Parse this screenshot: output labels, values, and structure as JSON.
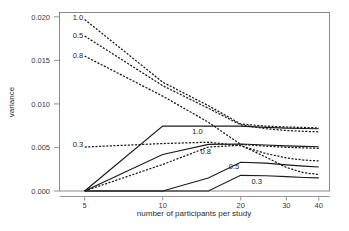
{
  "chart_data": {
    "type": "line",
    "title": "",
    "subtitle": "",
    "xlabel": "number of participants per study",
    "ylabel": "variance",
    "xscale": "log",
    "xlim": [
      4.0,
      44.0
    ],
    "ylim": [
      0.0,
      0.0205
    ],
    "xticks": [
      5,
      10,
      20,
      30,
      40
    ],
    "xticklabels": [
      "5",
      "10",
      "20",
      "30",
      "40"
    ],
    "yticks": [
      0.0,
      0.005,
      0.01,
      0.015,
      0.02
    ],
    "yticklabels": [
      "0.000",
      "0.005",
      "0.010",
      "0.015",
      "0.020"
    ],
    "grid": false,
    "legend": "inline-labels",
    "x": [
      5,
      10,
      15,
      20,
      25,
      30,
      35,
      40
    ],
    "series": [
      {
        "name": "1.0",
        "style": "dashed",
        "label": "1.0",
        "label_x": 5,
        "label_y": 0.0199,
        "values": [
          0.0197,
          0.0125,
          0.0098,
          0.0077,
          0.00745,
          0.00735,
          0.0073,
          0.00725
        ]
      },
      {
        "name": "0.5",
        "style": "dashed",
        "label": "0.5",
        "label_x": 5,
        "label_y": 0.0179,
        "values": [
          0.0178,
          0.0121,
          0.0095,
          0.0076,
          0.00715,
          0.00695,
          0.00685,
          0.0068
        ]
      },
      {
        "name": "0.8",
        "style": "dashed",
        "label": "0.8",
        "label_x": 5,
        "label_y": 0.0156,
        "values": [
          0.0155,
          0.0109,
          0.0079,
          0.00535,
          0.00515,
          0.00502,
          0.00495,
          0.0049
        ]
      },
      {
        "name": "0.3-dashed",
        "style": "dashed",
        "label": "0.3",
        "label_x": 5,
        "label_y": 0.0053,
        "values": [
          0.00505,
          0.00545,
          0.0056,
          0.0052,
          0.0043,
          0.0038,
          0.00355,
          0.00345
        ]
      },
      {
        "name": "0.5-dashed-low",
        "style": "dashed",
        "label": "",
        "values": [
          0.0,
          0.00305,
          0.00505,
          0.00525,
          0.0039,
          0.0027,
          0.0021,
          0.0019
        ]
      },
      {
        "name": "1.0-solid",
        "style": "solid",
        "label": "1.0",
        "label_x": 13,
        "label_y": 0.0069,
        "values": [
          0.0,
          0.00745,
          0.00745,
          0.00745,
          0.0073,
          0.00722,
          0.00718,
          0.00715
        ]
      },
      {
        "name": "0.8-solid",
        "style": "solid",
        "label": "0.8",
        "label_x": 14,
        "label_y": 0.0046,
        "values": [
          0.0,
          0.0042,
          0.00535,
          0.0054,
          0.00528,
          0.00518,
          0.00512,
          0.00508
        ]
      },
      {
        "name": "0.5-solid",
        "style": "solid",
        "label": "0.5",
        "label_x": 18,
        "label_y": 0.0028,
        "values": [
          0.0,
          0.0,
          0.0015,
          0.0033,
          0.0032,
          0.003,
          0.00285,
          0.00275
        ]
      },
      {
        "name": "0.3-solid",
        "style": "solid",
        "label": "0.3",
        "label_x": 22,
        "label_y": 0.0011,
        "values": [
          0.0,
          0.0,
          0.0,
          0.0018,
          0.00175,
          0.00165,
          0.00155,
          0.0015
        ]
      }
    ]
  },
  "axes": {
    "xlabel": "number of participants per study",
    "ylabel": "variance"
  }
}
